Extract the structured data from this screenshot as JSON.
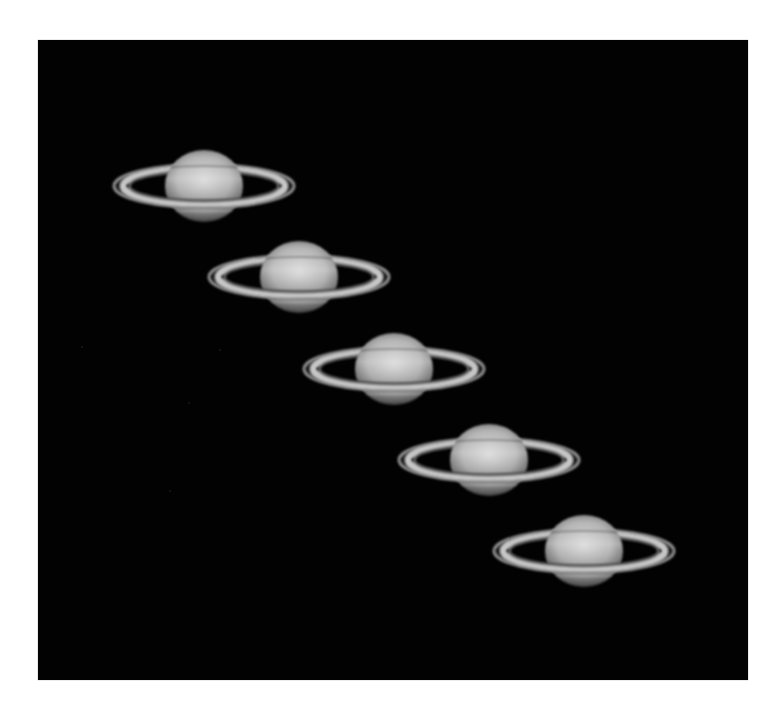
{
  "image": {
    "subject": "Saturn time-sequence composite",
    "frame_count": 5,
    "background_color": "#020202",
    "page_color": "#ffffff"
  },
  "frames": [
    {
      "index": 1,
      "cx": 204,
      "cy": 186
    },
    {
      "index": 2,
      "cx": 299,
      "cy": 277
    },
    {
      "index": 3,
      "cx": 394,
      "cy": 369
    },
    {
      "index": 4,
      "cx": 489,
      "cy": 460
    },
    {
      "index": 5,
      "cx": 584,
      "cy": 551
    }
  ],
  "colors": {
    "globe_highlight": "#d8d8d8",
    "globe_mid": "#a8a8a8",
    "globe_limb": "#3c3c3c",
    "ring_a": "#8c8c8c",
    "cassini_division": "#1a1a1a",
    "ring_b": "#c8c8c8",
    "ring_inner": "#5a5a5a",
    "belt_dark": "#7a7a7a"
  }
}
